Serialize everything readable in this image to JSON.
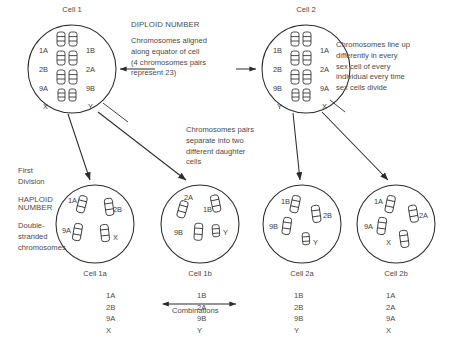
{
  "figure": {
    "background": "#ffffff",
    "ink": "#333333"
  },
  "parent_cells": [
    {
      "id": "cell-1",
      "title": "Cell 1",
      "left_column": [
        "1A",
        "2B",
        "9A",
        "X"
      ],
      "right_column": [
        "1B",
        "2A",
        "9B",
        "Y"
      ]
    },
    {
      "id": "cell-2",
      "title": "Cell 2",
      "left_column": [
        "1B",
        "2B",
        "9B",
        "Y"
      ],
      "right_column": [
        "1A",
        "2A",
        "9A",
        "X"
      ]
    }
  ],
  "annotations": {
    "diploid_heading": "DIPLOID NUMBER",
    "diploid_body": "Chromosomes aligned\nalong equator of cell\n(4 chromosomes pairs\nrepresent 23)",
    "lineup_body": "Chromosomes line up\ndifferently in every\nsex cell of every\nindividual every time\nsex cells divide",
    "separate_body": "Chromosomes pairs\nseparate into two\ndifferent daughter\ncells",
    "first_division": "First\nDivision",
    "haploid_heading": "HAPLOID\nNUMBER",
    "double_stranded": "Double-\nstranded\nchromosomes",
    "combinations": "Combinations"
  },
  "daughter_cells": [
    {
      "id": "cell-1a",
      "title": "Cell 1a",
      "markers": [
        {
          "label": "1A",
          "side": "left",
          "row": "top"
        },
        {
          "label": "2B",
          "side": "right",
          "row": "top"
        },
        {
          "label": "9A",
          "side": "left",
          "row": "bottom"
        },
        {
          "label": "X",
          "side": "right",
          "row": "bottom"
        }
      ],
      "list": [
        "1A",
        "2B",
        "9A",
        "X"
      ]
    },
    {
      "id": "cell-1b",
      "title": "Cell 1b",
      "markers": [
        {
          "label": "2A",
          "side": "left",
          "row": "top"
        },
        {
          "label": "1B",
          "side": "right",
          "row": "top"
        },
        {
          "label": "9B",
          "side": "left",
          "row": "bottom"
        },
        {
          "label": "Y",
          "side": "right",
          "row": "bottom"
        }
      ],
      "list": [
        "1B",
        "2A",
        "9B",
        "Y"
      ]
    },
    {
      "id": "cell-2a",
      "title": "Cell 2a",
      "markers": [
        {
          "label": "1B",
          "side": "left",
          "row": "top"
        },
        {
          "label": "2B",
          "side": "right",
          "row": "top"
        },
        {
          "label": "9B",
          "side": "left",
          "row": "bottom"
        },
        {
          "label": "Y",
          "side": "right",
          "row": "bottom"
        }
      ],
      "list": [
        "1B",
        "2B",
        "9B",
        "Y"
      ]
    },
    {
      "id": "cell-2b",
      "title": "Cell 2b",
      "markers": [
        {
          "label": "1A",
          "side": "left",
          "row": "top"
        },
        {
          "label": "2A",
          "side": "right",
          "row": "top"
        },
        {
          "label": "9A",
          "side": "left",
          "row": "bottom"
        },
        {
          "label": "X",
          "side": "right",
          "row": "bottom"
        }
      ],
      "list": [
        "1A",
        "2A",
        "9A",
        "X"
      ]
    }
  ]
}
